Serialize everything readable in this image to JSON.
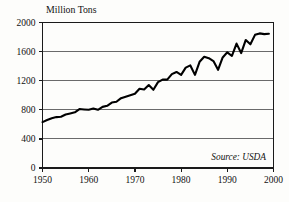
{
  "figure": {
    "name": "us-grain-production-chart",
    "background_color": "#fdfdfb",
    "line_color": "#000000",
    "grid_color": "#5a5a5a",
    "axis_color": "#1a1a1a"
  },
  "title": "Million Tons",
  "source_note": "Source: USDA",
  "axes": {
    "y_ticks": [
      "0",
      "400",
      "800",
      "1200",
      "1600",
      "2000"
    ],
    "x_ticks": [
      "1950",
      "1960",
      "1970",
      "1980",
      "1990",
      "2000"
    ],
    "xlim": [
      1950,
      2000
    ],
    "ylim": [
      0,
      2000
    ]
  },
  "chart_data": {
    "type": "line",
    "title": "Million Tons",
    "xlabel": "",
    "ylabel": "Million Tons",
    "xlim": [
      1950,
      2000
    ],
    "ylim": [
      0,
      2000
    ],
    "grid": true,
    "legend": false,
    "annotations": [
      "Source: USDA"
    ],
    "x": [
      1950,
      1951,
      1952,
      1953,
      1954,
      1955,
      1956,
      1957,
      1958,
      1959,
      1960,
      1961,
      1962,
      1963,
      1964,
      1965,
      1966,
      1967,
      1968,
      1969,
      1970,
      1971,
      1972,
      1973,
      1974,
      1975,
      1976,
      1977,
      1978,
      1979,
      1980,
      1981,
      1982,
      1983,
      1984,
      1985,
      1986,
      1987,
      1988,
      1989,
      1990,
      1991,
      1992,
      1993,
      1994,
      1995,
      1996,
      1997,
      1998,
      1999
    ],
    "y": [
      631,
      660,
      685,
      700,
      705,
      735,
      750,
      765,
      810,
      805,
      800,
      818,
      800,
      840,
      855,
      900,
      910,
      960,
      980,
      1000,
      1020,
      1090,
      1080,
      1140,
      1075,
      1180,
      1215,
      1215,
      1290,
      1320,
      1280,
      1380,
      1410,
      1280,
      1460,
      1530,
      1510,
      1470,
      1350,
      1520,
      1590,
      1540,
      1710,
      1580,
      1760,
      1700,
      1830,
      1850,
      1840,
      1845
    ],
    "series": [
      {
        "name": "World grain production",
        "values": [
          631,
          660,
          685,
          700,
          705,
          735,
          750,
          765,
          810,
          805,
          800,
          818,
          800,
          840,
          855,
          900,
          910,
          960,
          980,
          1000,
          1020,
          1090,
          1080,
          1140,
          1075,
          1180,
          1215,
          1215,
          1290,
          1320,
          1280,
          1380,
          1410,
          1280,
          1460,
          1530,
          1510,
          1470,
          1350,
          1520,
          1590,
          1540,
          1710,
          1580,
          1760,
          1700,
          1830,
          1850,
          1840,
          1845
        ]
      }
    ]
  }
}
